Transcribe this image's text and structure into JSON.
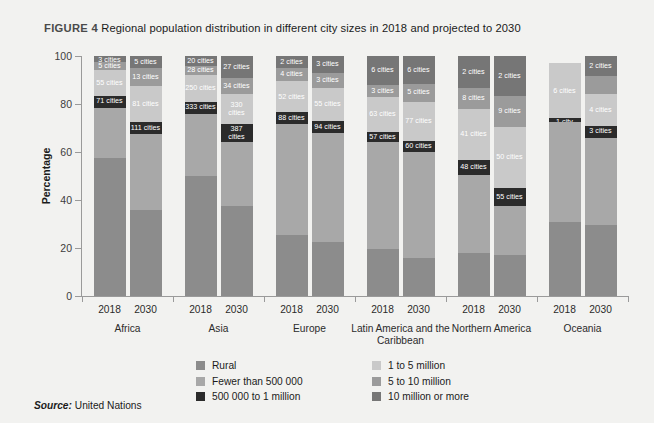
{
  "title": {
    "figure_number": "FIGURE 4",
    "text": "Regional population distribution in different city sizes in 2018 and projected to 2030"
  },
  "source": {
    "label": "Source:",
    "text": "United Nations"
  },
  "legend": {
    "left": [
      {
        "label": "Rural",
        "color": "#8c8c8c"
      },
      {
        "label": "Fewer than 500 000",
        "color": "#a8a8a8"
      },
      {
        "label": "500 000 to 1 million",
        "color": "#2b2b2b"
      }
    ],
    "right": [
      {
        "label": "1 to 5 million",
        "color": "#c9c9c9"
      },
      {
        "label": "5 to 10 million",
        "color": "#9b9b9b"
      },
      {
        "label": "10 million or more",
        "color": "#767676"
      }
    ]
  },
  "chart_data": {
    "type": "bar",
    "subtype": "stacked-percentage",
    "title": "Regional population distribution in different city sizes in 2018 and projected to 2030",
    "xlabel": "",
    "ylabel": "Percentage",
    "ylim": [
      0,
      100
    ],
    "yticks": [
      0,
      20,
      40,
      60,
      80,
      100
    ],
    "grid": false,
    "legend_position": "bottom",
    "categories": [
      "Africa 2018",
      "Africa 2030",
      "Asia 2018",
      "Asia 2030",
      "Europe 2018",
      "Europe 2030",
      "Latin America and the Caribbean 2018",
      "Latin America and the Caribbean 2030",
      "Northern America 2018",
      "Northern America 2030",
      "Oceania 2018",
      "Oceania 2030"
    ],
    "regions": [
      "Africa",
      "Asia",
      "Europe",
      "Latin America and the Caribbean",
      "Northern America",
      "Oceania"
    ],
    "years": [
      "2018",
      "2030"
    ],
    "series": [
      {
        "name": "Rural",
        "color": "#8c8c8c",
        "values": [
          57.5,
          36.0,
          50.0,
          37.5,
          25.5,
          22.5,
          19.5,
          16.0,
          18.0,
          17.0,
          31.0,
          29.5
        ]
      },
      {
        "name": "Fewer than 500 000",
        "color": "#a8a8a8",
        "values": [
          21.0,
          31.5,
          26.0,
          26.5,
          46.0,
          45.5,
          44.5,
          44.0,
          32.5,
          20.5,
          41.5,
          36.5
        ]
      },
      {
        "name": "500 000 to 1 million",
        "color": "#2b2b2b",
        "values": [
          5.0,
          5.0,
          5.0,
          7.5,
          5.0,
          5.0,
          4.5,
          4.5,
          6.0,
          7.5,
          1.5,
          5.0
        ]
      },
      {
        "name": "1 to 5 million",
        "color": "#c9c9c9",
        "values": [
          10.5,
          15.0,
          11.0,
          12.5,
          13.0,
          13.5,
          14.5,
          16.5,
          21.5,
          25.5,
          23.0,
          13.0
        ]
      },
      {
        "name": "5 to 10 million",
        "color": "#9b9b9b",
        "values": [
          3.5,
          7.5,
          4.0,
          7.0,
          5.5,
          6.5,
          5.0,
          7.5,
          8.5,
          13.0,
          0.0,
          7.5
        ]
      },
      {
        "name": "10 million or more",
        "color": "#767676",
        "values": [
          2.5,
          5.0,
          4.0,
          9.0,
          5.0,
          7.0,
          12.0,
          11.5,
          13.5,
          16.5,
          0.0,
          8.5
        ]
      }
    ],
    "bars": [
      {
        "region": "Africa",
        "year": "2018",
        "segments": [
          {
            "series": "Rural",
            "value": 57.5,
            "label": ""
          },
          {
            "series": "Fewer than 500 000",
            "value": 21.0,
            "label": ""
          },
          {
            "series": "500 000 to 1 million",
            "value": 5.0,
            "label": "71 cities"
          },
          {
            "series": "1 to 5 million",
            "value": 10.5,
            "label": "55 cities"
          },
          {
            "series": "5 to 10 million",
            "value": 3.5,
            "label": "5 cities"
          },
          {
            "series": "10 million or more",
            "value": 2.5,
            "label": "3 cities"
          }
        ]
      },
      {
        "region": "Africa",
        "year": "2030",
        "segments": [
          {
            "series": "Rural",
            "value": 36.0,
            "label": ""
          },
          {
            "series": "Fewer than 500 000",
            "value": 31.5,
            "label": ""
          },
          {
            "series": "500 000 to 1 million",
            "value": 5.0,
            "label": "111 cities"
          },
          {
            "series": "1 to 5 million",
            "value": 15.0,
            "label": "81 cities"
          },
          {
            "series": "5 to 10 million",
            "value": 7.5,
            "label": "13 cities"
          },
          {
            "series": "10 million or more",
            "value": 5.0,
            "label": "5 cities"
          }
        ]
      },
      {
        "region": "Asia",
        "year": "2018",
        "segments": [
          {
            "series": "Rural",
            "value": 50.0,
            "label": ""
          },
          {
            "series": "Fewer than 500 000",
            "value": 26.0,
            "label": ""
          },
          {
            "series": "500 000 to 1 million",
            "value": 5.0,
            "label": "333 cities"
          },
          {
            "series": "1 to 5 million",
            "value": 11.0,
            "label": "250 cities"
          },
          {
            "series": "5 to 10 million",
            "value": 4.0,
            "label": "28 cities"
          },
          {
            "series": "10 million or more",
            "value": 4.0,
            "label": "20 cities"
          }
        ]
      },
      {
        "region": "Asia",
        "year": "2030",
        "segments": [
          {
            "series": "Rural",
            "value": 37.5,
            "label": ""
          },
          {
            "series": "Fewer than 500 000",
            "value": 26.5,
            "label": ""
          },
          {
            "series": "500 000 to 1 million",
            "value": 7.5,
            "label": "387\ncities"
          },
          {
            "series": "1 to 5 million",
            "value": 12.5,
            "label": "330\ncities"
          },
          {
            "series": "5 to 10 million",
            "value": 7.0,
            "label": "34 cities"
          },
          {
            "series": "10 million or more",
            "value": 9.0,
            "label": "27 cities"
          }
        ]
      },
      {
        "region": "Europe",
        "year": "2018",
        "segments": [
          {
            "series": "Rural",
            "value": 25.5,
            "label": ""
          },
          {
            "series": "Fewer than 500 000",
            "value": 46.0,
            "label": ""
          },
          {
            "series": "500 000 to 1 million",
            "value": 5.0,
            "label": "88 cities"
          },
          {
            "series": "1 to 5 million",
            "value": 13.0,
            "label": "52 cities"
          },
          {
            "series": "5 to 10 million",
            "value": 5.5,
            "label": "4 cities"
          },
          {
            "series": "10 million or more",
            "value": 5.0,
            "label": "2 cities"
          }
        ]
      },
      {
        "region": "Europe",
        "year": "2030",
        "segments": [
          {
            "series": "Rural",
            "value": 22.5,
            "label": ""
          },
          {
            "series": "Fewer than 500 000",
            "value": 45.5,
            "label": ""
          },
          {
            "series": "500 000 to 1 million",
            "value": 5.0,
            "label": "94 cities"
          },
          {
            "series": "1 to 5 million",
            "value": 13.5,
            "label": "55 cities"
          },
          {
            "series": "5 to 10 million",
            "value": 6.5,
            "label": "3 cities"
          },
          {
            "series": "10 million or more",
            "value": 7.0,
            "label": "3 cities"
          }
        ]
      },
      {
        "region": "Latin America and the Caribbean",
        "year": "2018",
        "segments": [
          {
            "series": "Rural",
            "value": 19.5,
            "label": ""
          },
          {
            "series": "Fewer than 500 000",
            "value": 44.5,
            "label": ""
          },
          {
            "series": "500 000 to 1 million",
            "value": 4.5,
            "label": "57 cities"
          },
          {
            "series": "1 to 5 million",
            "value": 14.5,
            "label": "63 cities"
          },
          {
            "series": "5 to 10 million",
            "value": 5.0,
            "label": "3 cities"
          },
          {
            "series": "10 million or more",
            "value": 12.0,
            "label": "6 cities"
          }
        ]
      },
      {
        "region": "Latin America and the Caribbean",
        "year": "2030",
        "segments": [
          {
            "series": "Rural",
            "value": 16.0,
            "label": ""
          },
          {
            "series": "Fewer than 500 000",
            "value": 44.0,
            "label": ""
          },
          {
            "series": "500 000 to 1 million",
            "value": 4.5,
            "label": "60 cities"
          },
          {
            "series": "1 to 5 million",
            "value": 16.5,
            "label": "77 cities"
          },
          {
            "series": "5 to 10 million",
            "value": 7.5,
            "label": "5 cities"
          },
          {
            "series": "10 million or more",
            "value": 11.5,
            "label": "6 cities"
          }
        ]
      },
      {
        "region": "Northern America",
        "year": "2018",
        "segments": [
          {
            "series": "Rural",
            "value": 18.0,
            "label": ""
          },
          {
            "series": "Fewer than 500 000",
            "value": 32.5,
            "label": ""
          },
          {
            "series": "500 000 to 1 million",
            "value": 6.0,
            "label": "48 cities"
          },
          {
            "series": "1 to 5 million",
            "value": 21.5,
            "label": "41 cities"
          },
          {
            "series": "5 to 10 million",
            "value": 8.5,
            "label": "8 cities"
          },
          {
            "series": "10 million or more",
            "value": 13.5,
            "label": "2 cities"
          }
        ]
      },
      {
        "region": "Northern America",
        "year": "2030",
        "segments": [
          {
            "series": "Rural",
            "value": 17.0,
            "label": ""
          },
          {
            "series": "Fewer than 500 000",
            "value": 20.5,
            "label": ""
          },
          {
            "series": "500 000 to 1 million",
            "value": 7.5,
            "label": "55 cities"
          },
          {
            "series": "1 to 5 million",
            "value": 25.5,
            "label": "50 cities"
          },
          {
            "series": "5 to 10 million",
            "value": 13.0,
            "label": "9 cities"
          },
          {
            "series": "10 million or more",
            "value": 16.5,
            "label": "2 cities"
          }
        ]
      },
      {
        "region": "Oceania",
        "year": "2018",
        "segments": [
          {
            "series": "Rural",
            "value": 31.0,
            "label": ""
          },
          {
            "series": "Fewer than 500 000",
            "value": 41.5,
            "label": ""
          },
          {
            "series": "500 000 to 1 million",
            "value": 1.5,
            "label": "1 city"
          },
          {
            "series": "1 to 5 million",
            "value": 23.0,
            "label": "6 cities"
          },
          {
            "series": "5 to 10 million",
            "value": 0.0,
            "label": ""
          },
          {
            "series": "10 million or more",
            "value": 0.0,
            "label": ""
          }
        ]
      },
      {
        "region": "Oceania",
        "year": "2030",
        "segments": [
          {
            "series": "Rural",
            "value": 29.5,
            "label": ""
          },
          {
            "series": "Fewer than 500 000",
            "value": 36.5,
            "label": ""
          },
          {
            "series": "500 000 to 1 million",
            "value": 5.0,
            "label": "3 cities"
          },
          {
            "series": "1 to 5 million",
            "value": 13.0,
            "label": "4 cities"
          },
          {
            "series": "5 to 10 million",
            "value": 7.5,
            "label": ""
          },
          {
            "series": "10 million or more",
            "value": 8.5,
            "label": "2 cities"
          }
        ]
      }
    ]
  }
}
